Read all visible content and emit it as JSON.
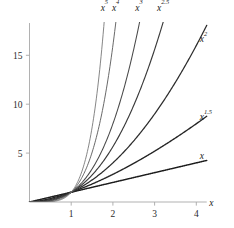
{
  "chart_data": {
    "type": "line",
    "title": "",
    "subtitle": "",
    "xlabel": "x",
    "ylabel": "",
    "xlim": [
      0,
      4.25
    ],
    "ylim": [
      0,
      18.3
    ],
    "grid": false,
    "legend": "inline-curve-end-labels",
    "x_ticks": [
      1,
      2,
      3,
      4
    ],
    "x_tick_labels": [
      "1",
      "2",
      "3",
      "4"
    ],
    "y_ticks": [
      5,
      10,
      15
    ],
    "y_tick_labels": [
      "5",
      "10",
      "15"
    ],
    "x": [
      0,
      0.25,
      0.5,
      0.75,
      1,
      1.25,
      1.5,
      1.75,
      2,
      2.25,
      2.5,
      2.75,
      3,
      3.25,
      3.5,
      3.75,
      4
    ],
    "series": [
      {
        "name": "x",
        "exponent": 1,
        "label_base": "x",
        "label_exponent": "",
        "color": "#1c1c1c",
        "width": 1.45,
        "values": [
          0,
          0.25,
          0.5,
          0.75,
          1,
          1.25,
          1.5,
          1.75,
          2,
          2.25,
          2.5,
          2.75,
          3,
          3.25,
          3.5,
          3.75,
          4
        ],
        "label_at": {
          "x": 4,
          "y": 4
        }
      },
      {
        "name": "x^1.5",
        "exponent": 1.5,
        "label_base": "x",
        "label_exponent": "1.5",
        "color": "#242424",
        "width": 1.35,
        "values": [
          0,
          0.125,
          0.354,
          0.65,
          1,
          1.398,
          1.837,
          2.315,
          2.828,
          3.375,
          3.953,
          4.56,
          5.196,
          5.861,
          6.548,
          7.262,
          8
        ],
        "label_at": {
          "x": 4,
          "y": 8
        }
      },
      {
        "name": "x^2",
        "exponent": 2,
        "label_base": "x",
        "label_exponent": "2",
        "color": "#2d2d2d",
        "width": 1.25,
        "values": [
          0,
          0.063,
          0.25,
          0.563,
          1,
          1.563,
          2.25,
          3.063,
          4,
          5.063,
          6.25,
          7.563,
          9,
          10.563,
          12.25,
          14.063,
          16
        ],
        "label_at": {
          "x": 4,
          "y": 16
        }
      },
      {
        "name": "x^2.5",
        "exponent": 2.5,
        "label_base": "x",
        "label_exponent": "2.5",
        "color": "#3a3a3a",
        "width": 1.15,
        "values": [
          0,
          0.031,
          0.177,
          0.487,
          1,
          1.747,
          2.756,
          4.051,
          5.657,
          7.594,
          9.882,
          12.54,
          15.588,
          19.04,
          22.92,
          27.23,
          32
        ],
        "label_at": {
          "x": 3.14,
          "y": 17.5
        }
      },
      {
        "name": "x^3",
        "exponent": 3,
        "label_base": "x",
        "label_exponent": "3",
        "color": "#4a4a4a",
        "width": 1.05,
        "values": [
          0,
          0.016,
          0.125,
          0.422,
          1,
          1.953,
          3.375,
          5.359,
          8,
          11.39,
          15.63,
          20.8,
          27,
          34.33,
          42.88,
          52.73,
          64
        ],
        "label_at": {
          "x": 2.62,
          "y": 17.9
        }
      },
      {
        "name": "x^4",
        "exponent": 4,
        "label_base": "x",
        "label_exponent": "4",
        "color": "#616161",
        "width": 0.95,
        "values": [
          0,
          0.004,
          0.063,
          0.316,
          1,
          2.441,
          5.063,
          9.379,
          16,
          25.63,
          39.06,
          57.19,
          81,
          111.6,
          150.1,
          197.8,
          256
        ],
        "label_at": {
          "x": 2.06,
          "y": 18.0
        }
      },
      {
        "name": "x^5",
        "exponent": 5,
        "label_base": "x",
        "label_exponent": "5",
        "color": "#787878",
        "width": 0.9,
        "values": [
          0,
          0.001,
          0.031,
          0.237,
          1,
          3.052,
          7.594,
          16.41,
          32,
          57.67,
          97.66,
          157.3,
          243,
          362.6,
          525.2,
          741.6,
          1024
        ],
        "label_at": {
          "x": 1.79,
          "y": 18.1
        }
      }
    ],
    "annotations": [],
    "axis_color": "#a8a8a8",
    "background_color": "#ffffff"
  },
  "axis": {
    "x_name": "x"
  }
}
